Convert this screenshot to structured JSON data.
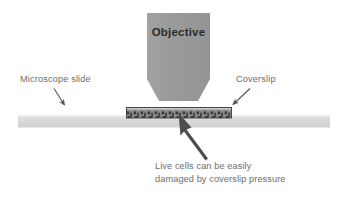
{
  "figure": {
    "type": "scientific-illustration",
    "background_color": "#ffffff",
    "width": 348,
    "height": 197
  },
  "objective": {
    "label": "Objective",
    "fill_color": "#9b9b9b",
    "text_color": "#2b2b2b"
  },
  "slide": {
    "label": "Microscope slide",
    "fill_color": "#dcdcdc",
    "text_color": "#6e6e6e"
  },
  "coverslip": {
    "label": "Coverslip",
    "fill_color": "#8a8a8a",
    "edge_color": "#3a3a3a",
    "text_color": "#6e6e6e"
  },
  "caption": {
    "line1": "Live cells can be easily",
    "line2": "damaged by coverslip pressure",
    "text_color": "#6e6e6e"
  },
  "arrows": {
    "slide_pointer": "arrow-down-right",
    "coverslip_pointer": "arrow-down-left",
    "cells_pointer": "arrow-up-left-thick",
    "color": "#555555"
  }
}
